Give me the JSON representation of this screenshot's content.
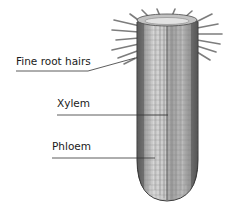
{
  "diagram": {
    "labels": [
      {
        "id": "fine-root-hairs",
        "text": "Fine root hairs"
      },
      {
        "id": "xylem",
        "text": "Xylem"
      },
      {
        "id": "phloem",
        "text": "Phloem"
      }
    ]
  }
}
